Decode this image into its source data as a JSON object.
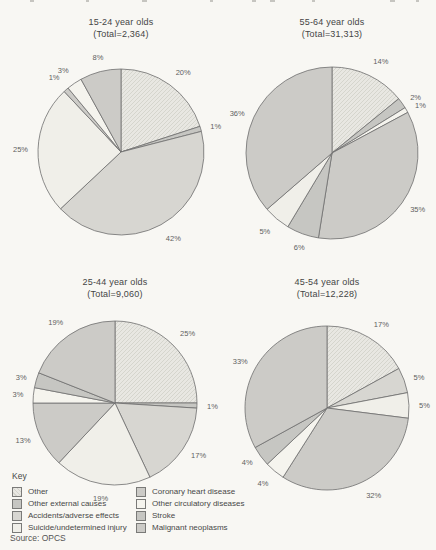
{
  "page": {
    "key_label": "Key",
    "source": "Source: OPCS"
  },
  "palette": {
    "hatch_base": "#e8e7e2",
    "hatch_line": "#d3d2cb",
    "g1": "#c6c6c2",
    "g2": "#cccbc7",
    "g3": "#d7d6d1",
    "w1": "#f0efe9",
    "w2": "#f5f4ee",
    "outline": "#6f6f6f",
    "label_color": "#5f5f5f"
  },
  "legend": {
    "left": [
      {
        "label": "Other",
        "fill": "hatch"
      },
      {
        "label": "Other external causes",
        "fill": "g1"
      },
      {
        "label": "Accidents/adverse effects",
        "fill": "g3"
      },
      {
        "label": "Suicide/undetermined injury",
        "fill": "w1"
      }
    ],
    "right": [
      {
        "label": "Coronary heart disease",
        "fill": "g2"
      },
      {
        "label": "Other circulatory diseases",
        "fill": "w2"
      },
      {
        "label": "Stroke",
        "fill": "g1"
      },
      {
        "label": "Malignant neoplasms",
        "fill": "g2"
      }
    ]
  },
  "chart_data": [
    {
      "type": "pie",
      "title": "15-24 year olds",
      "subtitle": "(Total=2,364)",
      "total": 2364,
      "start_angle": "12-o-clock",
      "direction": "clockwise",
      "slices": [
        {
          "category": "Other",
          "value": 20,
          "label": "20%",
          "fill": "hatch"
        },
        {
          "category": "Other external causes",
          "value": 1,
          "label": "1%",
          "fill": "g1"
        },
        {
          "category": "Accidents/adverse effects",
          "value": 42,
          "label": "42%",
          "fill": "g3"
        },
        {
          "category": "Suicide/undetermined injury",
          "value": 25,
          "label": "25%",
          "fill": "w1"
        },
        {
          "category": "Coronary heart disease",
          "value": 1,
          "label": "1%",
          "fill": "g2"
        },
        {
          "category": "Other circulatory diseases",
          "value": 3,
          "label": "3%",
          "fill": "w2"
        },
        {
          "category": "Malignant neoplasms",
          "value": 8,
          "label": "8%",
          "fill": "g2"
        }
      ]
    },
    {
      "type": "pie",
      "title": "55-64 year olds",
      "subtitle": "(Total=31,313)",
      "total": 31313,
      "start_angle": "12-o-clock",
      "direction": "clockwise",
      "slices": [
        {
          "category": "Other",
          "value": 14,
          "label": "14%",
          "fill": "hatch"
        },
        {
          "category": "Other external causes",
          "value": 2,
          "label": "2%",
          "fill": "g1"
        },
        {
          "category": "Accidents/adverse effects",
          "value": 1,
          "label": "1%",
          "fill": "w2"
        },
        {
          "category": "Coronary heart disease",
          "value": 35,
          "label": "35%",
          "fill": "g2"
        },
        {
          "category": "Other circulatory diseases",
          "value": 6,
          "label": "6%",
          "fill": "g1"
        },
        {
          "category": "Stroke",
          "value": 5,
          "label": "5%",
          "fill": "w1"
        },
        {
          "category": "Malignant neoplasms",
          "value": 36,
          "label": "36%",
          "fill": "g2"
        }
      ]
    },
    {
      "type": "pie",
      "title": "25-44 year olds",
      "subtitle": "(Total=9,060)",
      "total": 9060,
      "start_angle": "12-o-clock",
      "direction": "clockwise",
      "slices": [
        {
          "category": "Other",
          "value": 25,
          "label": "25%",
          "fill": "hatch"
        },
        {
          "category": "Other external causes",
          "value": 1,
          "label": "1%",
          "fill": "g1"
        },
        {
          "category": "Accidents/adverse effects",
          "value": 17,
          "label": "17%",
          "fill": "g3"
        },
        {
          "category": "Suicide/undetermined injury",
          "value": 19,
          "label": "19%",
          "fill": "w1"
        },
        {
          "category": "Coronary heart disease",
          "value": 13,
          "label": "13%",
          "fill": "g2"
        },
        {
          "category": "Other circulatory diseases",
          "value": 3,
          "label": "3%",
          "fill": "w2"
        },
        {
          "category": "Stroke",
          "value": 3,
          "label": "3%",
          "fill": "g1"
        },
        {
          "category": "Malignant neoplasms",
          "value": 19,
          "label": "19%",
          "fill": "g2"
        }
      ]
    },
    {
      "type": "pie",
      "title": "45-54 year olds",
      "subtitle": "(Total=12,228)",
      "total": 12228,
      "start_angle": "12-o-clock",
      "direction": "clockwise",
      "slices": [
        {
          "category": "Other",
          "value": 17,
          "label": "17%",
          "fill": "hatch"
        },
        {
          "category": "Accidents/adverse effects",
          "value": 5,
          "label": "5%",
          "fill": "g3"
        },
        {
          "category": "Suicide/undetermined injury",
          "value": 5,
          "label": "5%",
          "fill": "w1"
        },
        {
          "category": "Coronary heart disease",
          "value": 32,
          "label": "32%",
          "fill": "g2"
        },
        {
          "category": "Other circulatory diseases",
          "value": 4,
          "label": "4%",
          "fill": "w2"
        },
        {
          "category": "Stroke",
          "value": 4,
          "label": "4%",
          "fill": "g1"
        },
        {
          "category": "Malignant neoplasms",
          "value": 33,
          "label": "33%",
          "fill": "g2"
        }
      ]
    }
  ],
  "layout_hints": {
    "legend_position": "bottom-left",
    "labels": "outside, percent"
  }
}
